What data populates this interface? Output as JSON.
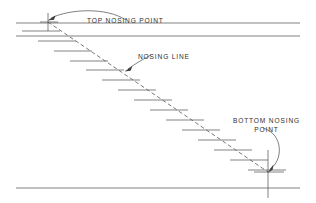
{
  "drawing": {
    "title": "Stair Nosing Line Section Diagram",
    "canvas": {
      "width": 316,
      "height": 203
    },
    "style": {
      "line_color": "#4a4a4a",
      "text_color": "#2e2e2e",
      "dashed_color": "#6a6a6a",
      "background": "#ffffff"
    },
    "labels": {
      "top_nosing_point": "TOP NOSING POINT",
      "nosing_line": "NOSING LINE",
      "bottom_nosing_point_line1": "BOTTOM NOSING",
      "bottom_nosing_point_line2": "POINT"
    },
    "floor_lines": [
      {
        "name": "upper-floor-line",
        "x1": 16,
        "y1": 23,
        "x2": 300,
        "y2": 23
      },
      {
        "name": "upper-ceiling-line",
        "x1": 16,
        "y1": 36,
        "x2": 300,
        "y2": 36
      },
      {
        "name": "lower-floor-line",
        "x1": 16,
        "y1": 188,
        "x2": 300,
        "y2": 188
      }
    ],
    "nosing_line": {
      "name": "nosing-line-dashed",
      "x1": 48,
      "y1": 22,
      "x2": 268,
      "y2": 172,
      "dash_pattern": "4 2.6"
    },
    "markers": {
      "top_nosing_point": {
        "x": 48,
        "y": 22,
        "arm": 9
      },
      "bottom_nosing_point": {
        "x": 268,
        "y": 172,
        "arm": 9
      },
      "bottom_vertical": {
        "x": 268,
        "y1": 150,
        "y2": 198
      }
    },
    "treads": [
      {
        "index": 1,
        "x1": 22,
        "x2": 60,
        "y": 31
      },
      {
        "index": 2,
        "x1": 38,
        "x2": 76,
        "y": 41
      },
      {
        "index": 3,
        "x1": 54,
        "x2": 92,
        "y": 51
      },
      {
        "index": 4,
        "x1": 70,
        "x2": 108,
        "y": 61
      },
      {
        "index": 5,
        "x1": 86,
        "x2": 124,
        "y": 70
      },
      {
        "index": 6,
        "x1": 102,
        "x2": 140,
        "y": 80
      },
      {
        "index": 7,
        "x1": 118,
        "x2": 156,
        "y": 90
      },
      {
        "index": 8,
        "x1": 134,
        "x2": 172,
        "y": 100
      },
      {
        "index": 9,
        "x1": 150,
        "x2": 188,
        "y": 110
      },
      {
        "index": 10,
        "x1": 166,
        "x2": 204,
        "y": 120
      },
      {
        "index": 11,
        "x1": 182,
        "x2": 220,
        "y": 130
      },
      {
        "index": 12,
        "x1": 198,
        "x2": 236,
        "y": 140
      },
      {
        "index": 13,
        "x1": 214,
        "x2": 252,
        "y": 150
      },
      {
        "index": 14,
        "x1": 230,
        "x2": 268,
        "y": 160
      },
      {
        "index": 15,
        "x1": 248,
        "x2": 286,
        "y": 170
      }
    ],
    "leaders": [
      {
        "name": "top-nosing-leader",
        "path": "M 126 20 C 105 8 70 10 51 19",
        "arrow_at": {
          "x": 49,
          "y": 20,
          "angle": 200
        }
      },
      {
        "name": "nosing-line-leader",
        "path": "M 150 56 C 142 60 135 64 127 69",
        "arrow_at": {
          "x": 125,
          "y": 70,
          "angle": 215
        }
      },
      {
        "name": "bottom-nosing-leader",
        "path": "M 264 127 C 283 133 283 160 270 170",
        "arrow_at": {
          "x": 268,
          "y": 171,
          "angle": 125
        }
      }
    ]
  }
}
